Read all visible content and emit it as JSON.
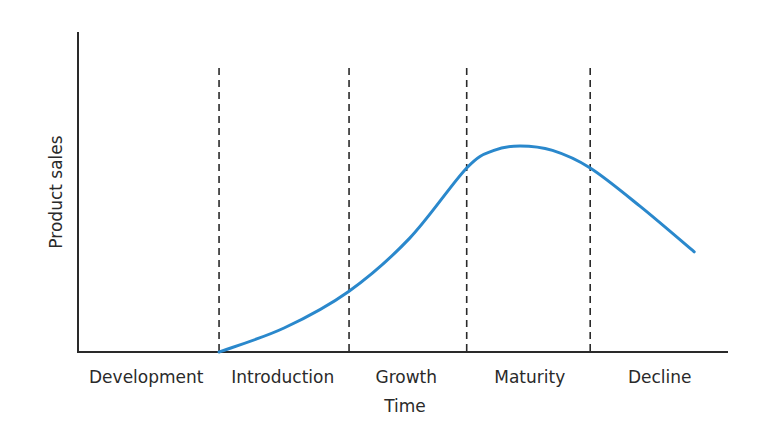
{
  "chart_data": {
    "type": "line",
    "title": "",
    "xlabel": "Time",
    "ylabel": "Product sales",
    "xlim": [
      0,
      100
    ],
    "ylim": [
      0,
      100
    ],
    "grid": false,
    "legend": "none",
    "stage_boundaries": [
      21.7,
      41.7,
      59.8,
      78.8
    ],
    "stages": [
      {
        "label": "Development",
        "center": 10.5
      },
      {
        "label": "Introduction",
        "center": 31.5
      },
      {
        "label": "Growth",
        "center": 50.5
      },
      {
        "label": "Maturity",
        "center": 69.5
      },
      {
        "label": "Decline",
        "center": 89.5
      }
    ],
    "series": [
      {
        "name": "Product sales",
        "color": "#2a88cc",
        "points": [
          [
            21.7,
            0
          ],
          [
            31.7,
            7.5
          ],
          [
            41.7,
            19.0
          ],
          [
            51.0,
            35.5
          ],
          [
            59.8,
            57.5
          ],
          [
            64.0,
            63.0
          ],
          [
            68.0,
            64.4
          ],
          [
            73.0,
            63.0
          ],
          [
            78.8,
            57.5
          ],
          [
            86.5,
            45.5
          ],
          [
            94.8,
            31.3
          ]
        ]
      }
    ]
  },
  "colors": {
    "axis": "#2a2a2a",
    "boundary": "#2a2a2a"
  }
}
